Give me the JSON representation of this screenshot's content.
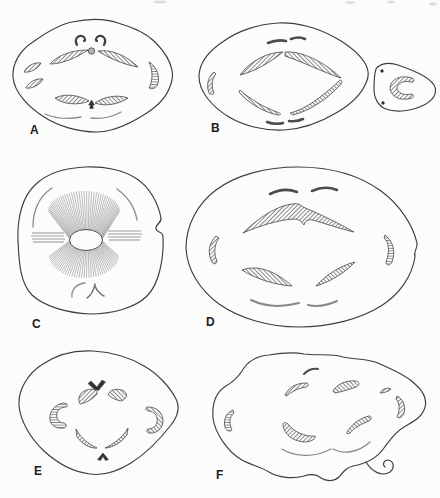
{
  "figure": {
    "paper_color": "#fcfcfa",
    "ink_color": "#3d3d3d",
    "hatch_color": "#5a5a5a",
    "panels": [
      {
        "label": "A"
      },
      {
        "label": "B"
      },
      {
        "label": "C"
      },
      {
        "label": "D"
      },
      {
        "label": "E"
      },
      {
        "label": "F"
      }
    ]
  }
}
